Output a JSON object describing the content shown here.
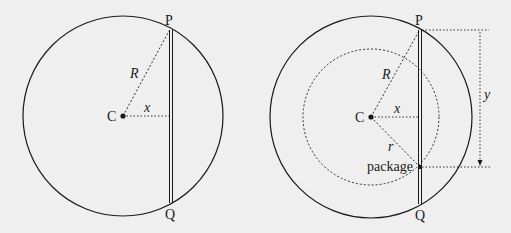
{
  "figures": [
    {
      "id": "left",
      "labels": {
        "top_point": "P",
        "bottom_point": "Q",
        "center": "C",
        "big_radius": "R",
        "distance": "x"
      }
    },
    {
      "id": "right",
      "labels": {
        "top_point": "P",
        "bottom_point": "Q",
        "center": "C",
        "big_radius": "R",
        "distance": "x",
        "small_radius": "r",
        "object": "package",
        "depth": "y"
      }
    }
  ],
  "colors": {
    "background": "#efefef",
    "stroke": "#1a1a1a"
  }
}
